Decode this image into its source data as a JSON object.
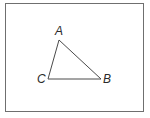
{
  "diagram": {
    "type": "triangle",
    "vertices": [
      {
        "name": "A",
        "x": 59,
        "y": 40,
        "label_x": 55,
        "label_y": 35
      },
      {
        "name": "B",
        "x": 101,
        "y": 79,
        "label_x": 103,
        "label_y": 83
      },
      {
        "name": "C",
        "x": 48,
        "y": 79,
        "label_x": 37,
        "label_y": 83
      }
    ],
    "stroke_color": "#4a4a4a",
    "frame_color": "#6f6f6f"
  }
}
